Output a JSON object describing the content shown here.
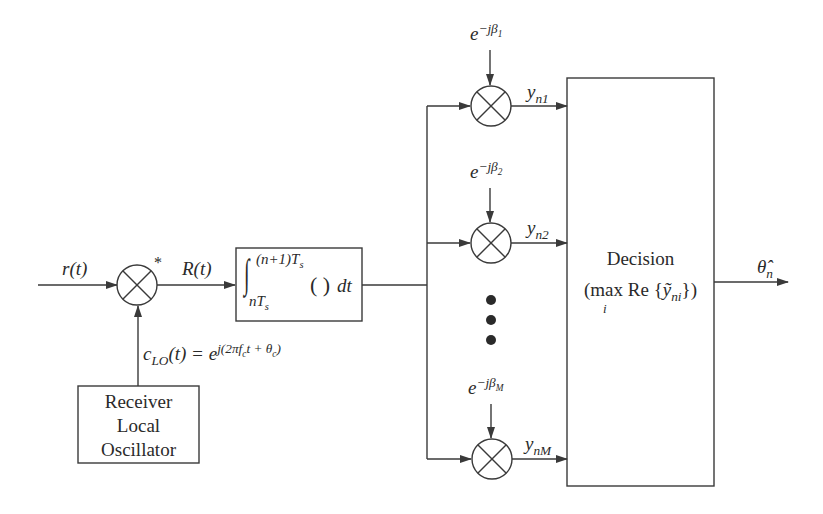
{
  "diagram": {
    "input_signal": "r(t)",
    "mixer_conjugate_mark": "*",
    "mixed_signal": "R(t)",
    "local_oscillator": {
      "label_lines": [
        "Receiver",
        "Local",
        "Oscillator"
      ],
      "output_expr_lhs": "c",
      "output_expr_lhs_sub": "LO",
      "output_expr_arg": "(t) = e",
      "output_expr_exponent": "j(2πf",
      "output_expr_exponent_sub": "c",
      "output_expr_exponent_rest": "t + θ",
      "output_expr_exponent_sub2": "c",
      "output_expr_exponent_close": ")"
    },
    "integrator": {
      "upper_limit": "(n+1)T",
      "upper_limit_sub": "s",
      "lower_limit": "nT",
      "lower_limit_sub": "s",
      "integrand": "(   )",
      "differential": "dt"
    },
    "branches": [
      {
        "phase_base": "e",
        "phase_exp": "−jβ",
        "phase_sub": "1",
        "output": "y",
        "output_sub": "n1"
      },
      {
        "phase_base": "e",
        "phase_exp": "−jβ",
        "phase_sub": "2",
        "output": "y",
        "output_sub": "n2"
      },
      {
        "phase_base": "e",
        "phase_exp": "−jβ",
        "phase_sub": "M",
        "output": "y",
        "output_sub": "nM"
      }
    ],
    "ellipsis": "• • •",
    "decision": {
      "title": "Decision",
      "rule_prefix": "(max",
      "rule_index": "i",
      "rule_body": "Re {",
      "rule_var": "ỹ",
      "rule_var_sub": "ni",
      "rule_close": "})"
    },
    "output": {
      "symbol": "θ̂",
      "sub": "n"
    },
    "colors": {
      "stroke": "#3a3a3a",
      "background": "#ffffff"
    }
  }
}
